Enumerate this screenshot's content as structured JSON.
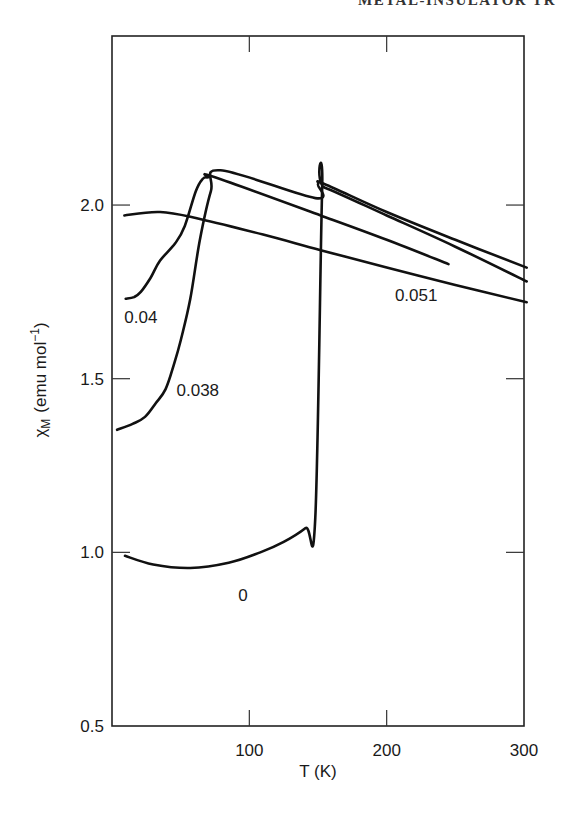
{
  "page": {
    "running_header": "METAL-INSULATOR TR"
  },
  "chart_data": {
    "type": "line",
    "title": "",
    "xlabel": "T (K)",
    "ylabel": "χM (emu mol⁻¹)",
    "ylabel_parts": {
      "symbol": "χ",
      "subscript": "M",
      "units": "(emu mol",
      "exp": "−1",
      "close": ")"
    },
    "xlim": [
      0,
      300
    ],
    "ylim": [
      0.5,
      2.5
    ],
    "x_ticks": [
      100,
      200,
      300
    ],
    "x_tick_labels": [
      "100",
      "200",
      "300"
    ],
    "y_ticks": [
      0.5,
      1.0,
      1.5,
      2.0
    ],
    "y_tick_labels": [
      "0.5",
      "1.0",
      "1.5",
      "2.0"
    ],
    "grid": false,
    "legend": "inline curve labels",
    "series": [
      {
        "name": "0",
        "label_pos": {
          "T": 92,
          "chi": 0.86
        },
        "points": [
          [
            9.5,
            0.99
          ],
          [
            30,
            0.965
          ],
          [
            57,
            0.955
          ],
          [
            85,
            0.97
          ],
          [
            108,
            1.0
          ],
          [
            125,
            1.03
          ],
          [
            141,
            1.07
          ],
          [
            148,
            1.1
          ],
          [
            153,
            2.04
          ],
          [
            155,
            2.05
          ],
          [
            200,
            1.97
          ],
          [
            250,
            1.88
          ],
          [
            302,
            1.78
          ]
        ]
      },
      {
        "name": "0.038",
        "label_pos": {
          "T": 47,
          "chi": 1.45
        },
        "points": [
          [
            3.7,
            1.353
          ],
          [
            15,
            1.37
          ],
          [
            24,
            1.39
          ],
          [
            32,
            1.43
          ],
          [
            39,
            1.47
          ],
          [
            45,
            1.54
          ],
          [
            50,
            1.61
          ],
          [
            57,
            1.73
          ],
          [
            64,
            1.9
          ],
          [
            72,
            2.04
          ],
          [
            79,
            2.1
          ],
          [
            148,
            2.02
          ],
          [
            150,
            2.06
          ],
          [
            155,
            2.06
          ],
          [
            200,
            1.98
          ],
          [
            250,
            1.9
          ],
          [
            302,
            1.82
          ]
        ]
      },
      {
        "name": "0.04",
        "label_pos": {
          "T": 9,
          "chi": 1.66
        },
        "points": [
          [
            10,
            1.73
          ],
          [
            16,
            1.735
          ],
          [
            21,
            1.75
          ],
          [
            28,
            1.79
          ],
          [
            35,
            1.84
          ],
          [
            46,
            1.89
          ],
          [
            53,
            1.94
          ],
          [
            61,
            2.04
          ],
          [
            66,
            2.075
          ],
          [
            70,
            2.08
          ],
          [
            75,
            2.08
          ],
          [
            152,
            1.97
          ],
          [
            200,
            1.9
          ],
          [
            245,
            1.83
          ]
        ]
      },
      {
        "name": "0.051",
        "label_pos": {
          "T": 206,
          "chi": 1.725
        },
        "points": [
          [
            9,
            1.97
          ],
          [
            35,
            1.98
          ],
          [
            64,
            1.96
          ],
          [
            110,
            1.915
          ],
          [
            152,
            1.87
          ],
          [
            200,
            1.82
          ],
          [
            250,
            1.77
          ],
          [
            302,
            1.72
          ]
        ]
      }
    ]
  }
}
